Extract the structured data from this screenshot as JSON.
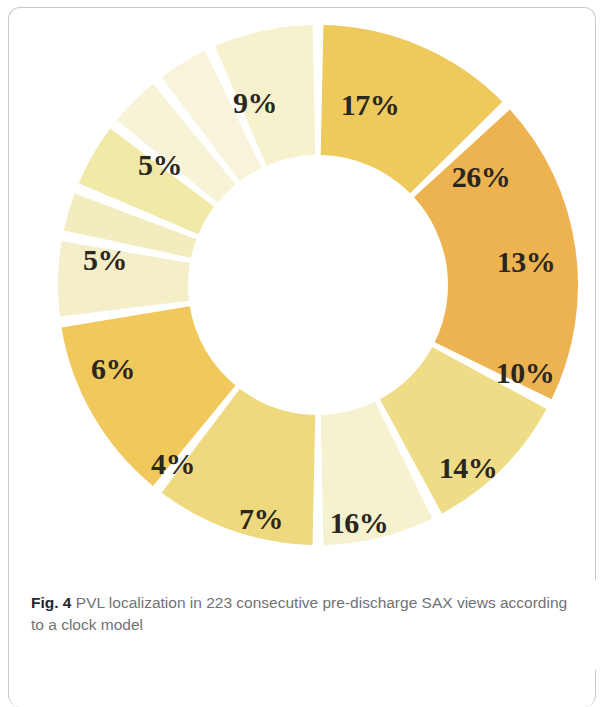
{
  "figure": {
    "caption_prefix": "Fig. 4",
    "caption_text": " PVL localization in 223 consecutive pre-discharge SAX views according to a clock model"
  },
  "chart_data": {
    "type": "pie",
    "variant": "donut",
    "title": "PVL localization in 223 consecutive pre-discharge SAX views according to a clock model",
    "total_cases": 223,
    "units": "percent",
    "start_angle_deg": 0,
    "direction": "clockwise",
    "inner_radius_ratio": 0.5,
    "gap_deg": 2.4,
    "legend": "none",
    "labels_inside_slice": true,
    "categories": [
      "1",
      "2",
      "3",
      "4",
      "5",
      "6",
      "7",
      "8",
      "9",
      "10",
      "11",
      "12"
    ],
    "values": [
      17,
      26,
      13,
      10,
      14,
      16,
      7,
      4,
      6,
      5,
      5,
      9
    ],
    "data_labels": [
      "17%",
      "26%",
      "13%",
      "10%",
      "14%",
      "16%",
      "7%",
      "4%",
      "6%",
      "5%",
      "5%",
      "9%"
    ],
    "colors": [
      "#eec95c",
      "#edb350",
      "#eedc86",
      "#f6f1ce",
      "#eed97e",
      "#f0c85c",
      "#f5efc9",
      "#f3ecbe",
      "#f1e9a8",
      "#f7f3d6",
      "#f8f4dc",
      "#f6f2cd"
    ],
    "slices": [
      {
        "label": "17%",
        "value": 17,
        "color": "#eec95c",
        "label_x": 370,
        "label_y": 105,
        "label_outside": false
      },
      {
        "label": "26%",
        "value": 26,
        "color": "#edb350",
        "label_x": 481,
        "label_y": 177,
        "label_outside": false
      },
      {
        "label": "13%",
        "value": 13,
        "color": "#eedc86",
        "label_x": 526,
        "label_y": 262,
        "label_outside": false
      },
      {
        "label": "10%",
        "value": 10,
        "color": "#f6f1ce",
        "label_x": 525,
        "label_y": 373,
        "label_outside": false
      },
      {
        "label": "14%",
        "value": 14,
        "color": "#eed97e",
        "label_x": 468,
        "label_y": 468,
        "label_outside": false
      },
      {
        "label": "16%",
        "value": 16,
        "color": "#f0c85c",
        "label_x": 359,
        "label_y": 523,
        "label_outside": false
      },
      {
        "label": "7%",
        "value": 7,
        "color": "#f5efc9",
        "label_x": 261,
        "label_y": 519,
        "label_outside": false
      },
      {
        "label": "4%",
        "value": 4,
        "color": "#f3ecbe",
        "label_x": 173,
        "label_y": 464,
        "label_outside": true
      },
      {
        "label": "6%",
        "value": 6,
        "color": "#f1e9a8",
        "label_x": 113,
        "label_y": 369,
        "label_outside": false
      },
      {
        "label": "5%",
        "value": 5,
        "color": "#f7f3d6",
        "label_x": 105,
        "label_y": 260,
        "label_outside": true
      },
      {
        "label": "5%",
        "value": 5,
        "color": "#f8f4dc",
        "label_x": 160,
        "label_y": 165,
        "label_outside": true
      },
      {
        "label": "9%",
        "value": 9,
        "color": "#f6f2cd",
        "label_x": 255,
        "label_y": 103,
        "label_outside": false
      }
    ],
    "geometry": {
      "center_x": 318,
      "center_y": 285,
      "outer_radius": 260,
      "inner_radius": 130
    }
  }
}
